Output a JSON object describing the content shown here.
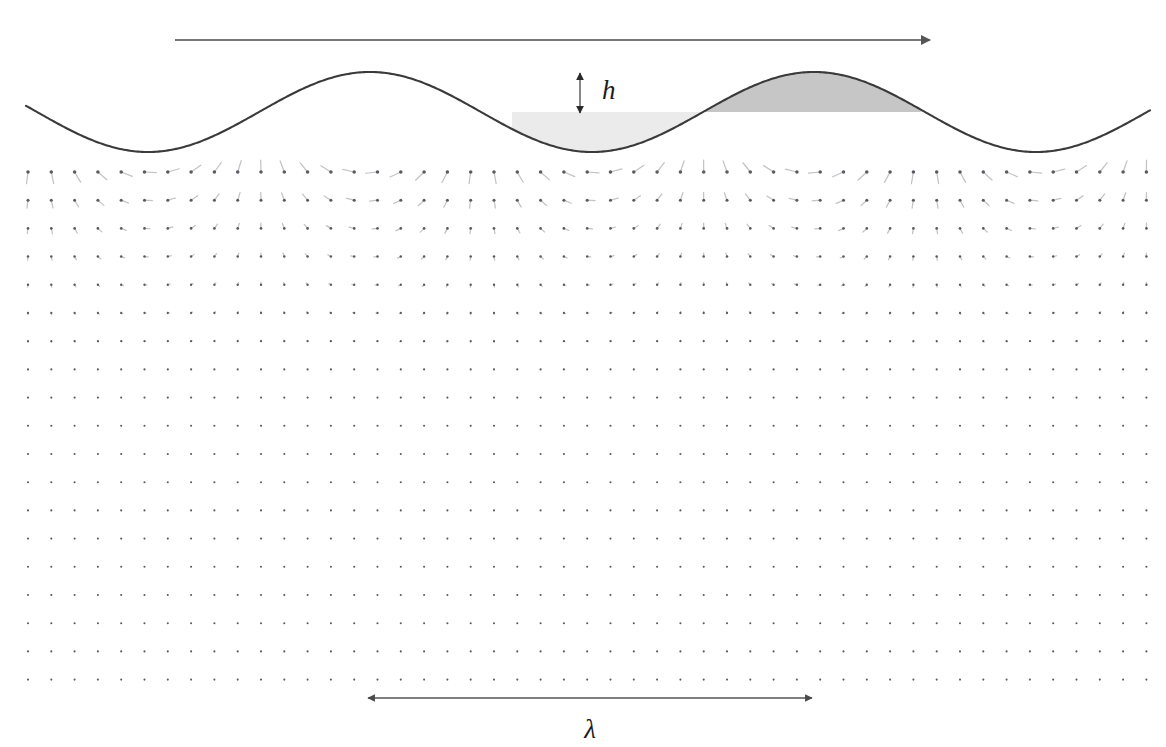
{
  "figure": {
    "background_color": "#ffffff"
  },
  "labels": {
    "wave_height": "h",
    "wavelength": "λ"
  },
  "annotations": {
    "propagation_arrow": {
      "name": "propagation-direction-arrow",
      "x1": 175,
      "y1": 40,
      "x2": 930,
      "y2": 40,
      "color": "#555555",
      "direction": "right"
    },
    "height_arrow": {
      "name": "wave-height-arrow",
      "x": 580,
      "y_top": 73,
      "y_bottom": 113,
      "double_headed": true,
      "color": "#2a2a2a",
      "label_x": 602,
      "label_y": 99,
      "label_size": 27
    },
    "wavelength_arrow": {
      "name": "wavelength-arrow",
      "x1": 368,
      "x2": 812,
      "y": 698,
      "double_headed": true,
      "color": "#4a4a4a",
      "label_x": 590,
      "label_y": 738,
      "label_size": 27
    }
  },
  "chart_data": {
    "type": "line",
    "xlabel": "",
    "ylabel": "",
    "grid": false,
    "legend": null,
    "surface": {
      "name": "free-surface-profile",
      "shape": "sinusoid",
      "mean_level_y": 112,
      "amplitude_px": 40,
      "wavelength_px": 444,
      "crest_x": [
        370,
        812
      ],
      "trough_x": [
        148,
        591,
        1035
      ],
      "x_start": 26,
      "x_end": 1150,
      "phase_offset_px": 370,
      "stroke_color": "#3a3a3a",
      "stroke_width": 2.1
    },
    "shading": {
      "below_mean_light": {
        "name": "trough-shading-region",
        "color": "#ebebeb",
        "x_start": 512,
        "x_end": 700,
        "description": "light fill between mean water level and depressed surface in the trough"
      },
      "above_mean_dark": {
        "name": "crest-shading-region",
        "color": "#c6c6c6",
        "x_start": 700,
        "x_end": 921,
        "description": "darker fill between mean water level and elevated surface at the crest"
      }
    },
    "velocity_field": {
      "name": "orbital-velocity-vectors",
      "description": "Deep-water wave orbital velocities. Magnitude decays as exp(k*z); vector angle rotates with phase so particles trace circles.",
      "grid_origin_x": 28,
      "grid_spacing_x": 23.3,
      "grid_columns": 49,
      "grid_origin_y": 172,
      "grid_spacing_y": 28.2,
      "grid_rows": 19,
      "wavenumber_px": 0.01415,
      "max_vector_length_px": 30,
      "decay_depth_px": 70.7,
      "dot_radius_px": 2.3,
      "dot_color": "#5a5a62",
      "tail_color": "#c3c3c3",
      "phase_reference_x": 370,
      "phase_note": "u = A*exp(k z)*cos(k(x - x_crest)); w = A*exp(k z)*sin(k(x - x_crest))"
    },
    "axis_ranges": {
      "x": [
        0,
        1166
      ],
      "y": [
        0,
        747
      ]
    }
  }
}
